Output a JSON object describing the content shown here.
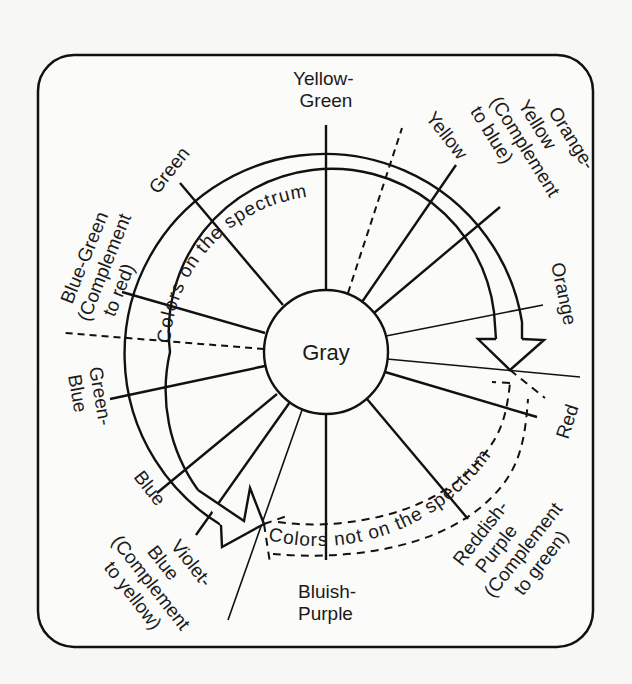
{
  "diagram": {
    "type": "color-circle",
    "center_label": "Gray",
    "arcs": {
      "spectrum_label": "Colors on the spectrum",
      "non_spectrum_label": "Colors not on the spectrum"
    },
    "colors": [
      {
        "id": "yellow-green",
        "lines": [
          "Yellow-",
          "Green"
        ]
      },
      {
        "id": "yellow",
        "lines": [
          "Yellow"
        ]
      },
      {
        "id": "orange-yellow",
        "lines": [
          "Orange-",
          "Yellow",
          "(Complement",
          "to blue)"
        ]
      },
      {
        "id": "orange",
        "lines": [
          "Orange"
        ]
      },
      {
        "id": "red",
        "lines": [
          "Red"
        ]
      },
      {
        "id": "reddish-purple",
        "lines": [
          "Reddish-",
          "Purple",
          "(Complement",
          "to green)"
        ]
      },
      {
        "id": "bluish-purple",
        "lines": [
          "Bluish-",
          "Purple"
        ]
      },
      {
        "id": "violet-blue",
        "lines": [
          "Violet-",
          "Blue",
          "(Complement",
          "to yellow)"
        ]
      },
      {
        "id": "blue",
        "lines": [
          "Blue"
        ]
      },
      {
        "id": "green-blue",
        "lines": [
          "Green-",
          "Blue"
        ]
      },
      {
        "id": "blue-green",
        "lines": [
          "Blue-Green",
          "(Complement",
          "to red)"
        ]
      },
      {
        "id": "green",
        "lines": [
          "Green"
        ]
      }
    ],
    "colors_ink": {
      "stroke": "#111111",
      "background": "#f7f7f5",
      "panel": "#fbfbf9"
    }
  }
}
